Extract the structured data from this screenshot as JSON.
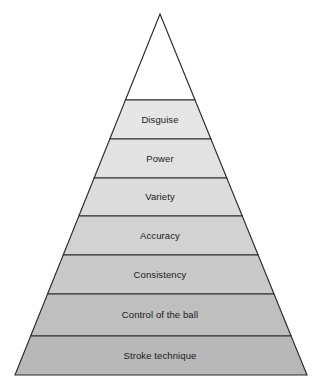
{
  "figure": {
    "name": "skill-pyramid",
    "type": "pyramid",
    "orientation": "apex-up",
    "background_color": "#ffffff",
    "outline_color": "#2b2b2b",
    "label_color": "#1a1a1a",
    "apex": {
      "x": 160,
      "y": 14,
      "filled": false,
      "fill_color": "#ffffff"
    },
    "base": {
      "left_x": 15,
      "right_x": 307,
      "y": 375
    },
    "tiers": [
      {
        "label": "Disguise",
        "top_y": 100,
        "bottom_y": 139,
        "fill_color": "#e6e6e6",
        "level": 7
      },
      {
        "label": "Power",
        "top_y": 139,
        "bottom_y": 178,
        "fill_color": "#e2e2e2",
        "level": 6
      },
      {
        "label": "Variety",
        "top_y": 178,
        "bottom_y": 216,
        "fill_color": "#dcdcdc",
        "level": 5
      },
      {
        "label": "Accuracy",
        "top_y": 216,
        "bottom_y": 255,
        "fill_color": "#d2d2d2",
        "level": 4
      },
      {
        "label": "Consistency",
        "top_y": 255,
        "bottom_y": 294,
        "fill_color": "#c9c9c9",
        "level": 3
      },
      {
        "label": "Control of the ball",
        "top_y": 294,
        "bottom_y": 336,
        "fill_color": "#bfbfbf",
        "level": 2
      },
      {
        "label": "Stroke technique",
        "top_y": 336,
        "bottom_y": 375,
        "fill_color": "#b8b8b8",
        "level": 1
      }
    ]
  }
}
